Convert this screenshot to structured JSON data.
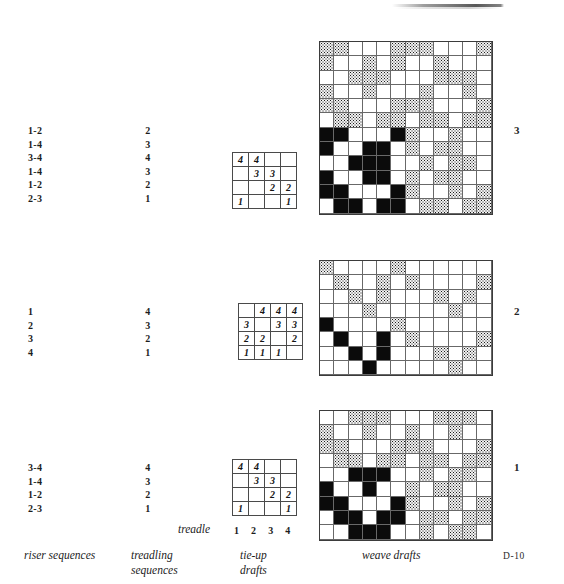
{
  "plate": {
    "id": "D-10",
    "artifact_top": true
  },
  "captions": {
    "riser": "riser sequences",
    "treadling": "treadling\nsequences",
    "tieup": "tie-up\ndrafts",
    "weave": "weave drafts",
    "treadle_label": "treadle",
    "treadle_numbers": "1 2 3 4"
  },
  "rows": [
    {
      "index_label": "3",
      "riser_sequence": [
        "1-2",
        "1-4",
        "3-4",
        "1-4",
        "1-2",
        "2-3"
      ],
      "treadling_sequence": [
        "2",
        "3",
        "4",
        "3",
        "2",
        "1"
      ],
      "tieup": [
        [
          "4",
          "4",
          "",
          ""
        ],
        [
          "",
          "3",
          "3",
          ""
        ],
        [
          "",
          "",
          "2",
          "2"
        ],
        [
          "1",
          "",
          "",
          "1"
        ]
      ],
      "weave": {
        "cols": 12,
        "rows": 12,
        "cells": [
          [
            "g",
            "g",
            "w",
            "w",
            "w",
            "g",
            "g",
            "g",
            "w",
            "w",
            "w",
            "g"
          ],
          [
            "g",
            "w",
            "w",
            "g",
            "w",
            "g",
            "w",
            "w",
            "g",
            "w",
            "w",
            "w"
          ],
          [
            "w",
            "w",
            "g",
            "g",
            "g",
            "w",
            "w",
            "w",
            "g",
            "g",
            "g",
            "w"
          ],
          [
            "g",
            "w",
            "w",
            "g",
            "w",
            "w",
            "w",
            "g",
            "w",
            "w",
            "g",
            "w"
          ],
          [
            "g",
            "g",
            "w",
            "w",
            "w",
            "g",
            "g",
            "g",
            "w",
            "w",
            "w",
            "g"
          ],
          [
            "w",
            "g",
            "g",
            "w",
            "g",
            "g",
            "w",
            "g",
            "g",
            "w",
            "g",
            "g"
          ],
          [
            "b",
            "b",
            "w",
            "w",
            "w",
            "b",
            "g",
            "w",
            "w",
            "g",
            "w",
            "w"
          ],
          [
            "b",
            "w",
            "w",
            "b",
            "b",
            "w",
            "g",
            "w",
            "g",
            "g",
            "w",
            "w"
          ],
          [
            "w",
            "w",
            "b",
            "b",
            "b",
            "w",
            "w",
            "g",
            "w",
            "g",
            "g",
            "w"
          ],
          [
            "b",
            "w",
            "w",
            "b",
            "b",
            "w",
            "g",
            "w",
            "g",
            "g",
            "w",
            "w"
          ],
          [
            "b",
            "b",
            "w",
            "w",
            "w",
            "b",
            "g",
            "w",
            "w",
            "g",
            "w",
            "g"
          ],
          [
            "w",
            "b",
            "b",
            "w",
            "b",
            "b",
            "w",
            "g",
            "g",
            "w",
            "g",
            "g"
          ]
        ]
      }
    },
    {
      "index_label": "2",
      "riser_sequence": [
        "1",
        "2",
        "3",
        "4"
      ],
      "treadling_sequence": [
        "4",
        "3",
        "2",
        "1"
      ],
      "tieup": [
        [
          "",
          "4",
          "4",
          "4"
        ],
        [
          "3",
          "",
          "3",
          "3"
        ],
        [
          "2",
          "2",
          "",
          "2"
        ],
        [
          "1",
          "1",
          "1",
          ""
        ]
      ],
      "weave": {
        "cols": 12,
        "rows": 8,
        "cells": [
          [
            "g",
            "w",
            "w",
            "w",
            "w",
            "g",
            "w",
            "w",
            "w",
            "w",
            "w",
            "w"
          ],
          [
            "w",
            "g",
            "w",
            "w",
            "g",
            "w",
            "g",
            "w",
            "w",
            "w",
            "w",
            "g"
          ],
          [
            "w",
            "w",
            "g",
            "w",
            "g",
            "w",
            "w",
            "w",
            "g",
            "w",
            "g",
            "w"
          ],
          [
            "w",
            "w",
            "w",
            "g",
            "w",
            "w",
            "w",
            "w",
            "w",
            "g",
            "w",
            "w"
          ],
          [
            "b",
            "w",
            "w",
            "w",
            "w",
            "g",
            "w",
            "w",
            "w",
            "w",
            "w",
            "w"
          ],
          [
            "w",
            "b",
            "w",
            "w",
            "b",
            "w",
            "g",
            "w",
            "w",
            "w",
            "w",
            "g"
          ],
          [
            "w",
            "w",
            "b",
            "w",
            "b",
            "w",
            "w",
            "w",
            "g",
            "w",
            "g",
            "w"
          ],
          [
            "w",
            "w",
            "w",
            "b",
            "w",
            "w",
            "w",
            "w",
            "w",
            "g",
            "w",
            "w"
          ]
        ]
      }
    },
    {
      "index_label": "1",
      "riser_sequence": [
        "3-4",
        "1-4",
        "1-2",
        "2-3"
      ],
      "treadling_sequence": [
        "4",
        "3",
        "2",
        "1"
      ],
      "tieup": [
        [
          "4",
          "4",
          "",
          ""
        ],
        [
          "",
          "3",
          "3",
          ""
        ],
        [
          "",
          "",
          "2",
          "2"
        ],
        [
          "1",
          "",
          "",
          "1"
        ]
      ],
      "weave": {
        "cols": 12,
        "rows": 9,
        "cells": [
          [
            "w",
            "w",
            "g",
            "g",
            "g",
            "w",
            "w",
            "w",
            "g",
            "g",
            "g",
            "w"
          ],
          [
            "g",
            "w",
            "w",
            "g",
            "w",
            "w",
            "g",
            "w",
            "w",
            "g",
            "w",
            "w"
          ],
          [
            "g",
            "g",
            "w",
            "w",
            "w",
            "g",
            "g",
            "g",
            "w",
            "w",
            "w",
            "g"
          ],
          [
            "w",
            "g",
            "g",
            "w",
            "g",
            "g",
            "w",
            "g",
            "g",
            "w",
            "g",
            "g"
          ],
          [
            "w",
            "w",
            "b",
            "b",
            "b",
            "w",
            "w",
            "g",
            "w",
            "g",
            "g",
            "w"
          ],
          [
            "b",
            "w",
            "w",
            "b",
            "w",
            "w",
            "g",
            "w",
            "g",
            "g",
            "w",
            "w"
          ],
          [
            "b",
            "b",
            "w",
            "w",
            "w",
            "b",
            "g",
            "w",
            "w",
            "g",
            "w",
            "g"
          ],
          [
            "w",
            "b",
            "b",
            "w",
            "b",
            "b",
            "w",
            "g",
            "g",
            "w",
            "g",
            "g"
          ],
          [
            "w",
            "w",
            "b",
            "b",
            "b",
            "w",
            "w",
            "g",
            "w",
            "g",
            "g",
            "w"
          ]
        ]
      }
    }
  ]
}
